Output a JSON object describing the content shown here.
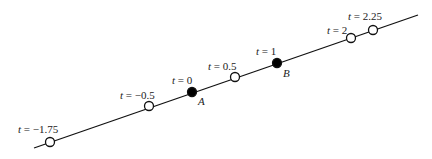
{
  "diagram": {
    "line": {
      "x1": 34,
      "y1": 148,
      "x2": 418,
      "y2": 15,
      "color": "#111111"
    },
    "points": [
      {
        "t_label": "t = −1.75",
        "x": 50,
        "y": 142,
        "filled": false,
        "label_x": 18,
        "label_y": 124
      },
      {
        "t_label": "t = −0.5",
        "x": 149,
        "y": 106,
        "filled": false,
        "label_x": 120,
        "label_y": 90
      },
      {
        "t_label": "t = 0",
        "x": 192,
        "y": 92,
        "filled": true,
        "label_x": 172,
        "label_y": 75,
        "name": "A",
        "name_x": 198,
        "name_y": 96
      },
      {
        "t_label": "t = 0.5",
        "x": 235,
        "y": 77,
        "filled": false,
        "label_x": 208,
        "label_y": 61
      },
      {
        "t_label": "t = 1",
        "x": 277,
        "y": 63,
        "filled": true,
        "label_x": 256,
        "label_y": 46,
        "name": "B",
        "name_x": 283,
        "name_y": 68
      },
      {
        "t_label": "t = 2",
        "x": 351,
        "y": 38,
        "filled": false,
        "label_x": 327,
        "label_y": 25
      },
      {
        "t_label": "t = 2.25",
        "x": 373,
        "y": 30,
        "filled": false,
        "label_x": 348,
        "label_y": 11
      }
    ]
  }
}
